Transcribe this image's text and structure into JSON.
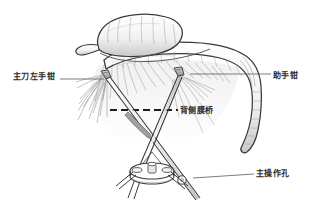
{
  "figure": {
    "kind": "medical-illustration",
    "background_color": "#ffffff",
    "ink_color": "#3a3a3a",
    "shading_color": "#9a9a9a",
    "width": 318,
    "height": 214
  },
  "labels": {
    "surgeon_left_forceps": "主刀左手钳",
    "assistant_forceps": "助手钳",
    "dorsal_membrane_bridge": "背侧膜桥",
    "main_operating_port": "主操作孔"
  },
  "structures": {
    "colon": "transverse-colon",
    "mesentery": "mesocolon-fat-strands",
    "dashed_guide": "dissection-plane-dashed-line",
    "trocar": "single-port-trocar-device",
    "instrument_left": "grasping-forceps-left",
    "instrument_right": "grasping-forceps-right"
  }
}
